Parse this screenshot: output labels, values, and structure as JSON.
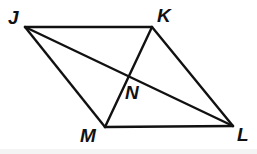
{
  "figure": {
    "name": "parallelogram-jklm-with-diagonals",
    "background_color": "#ffffff",
    "stroke_color": "#111111",
    "label_color": "#111111",
    "stroke_width": 2.4,
    "width": 257,
    "height": 154
  },
  "points": {
    "J": {
      "label": "J",
      "x": 25,
      "y": 27,
      "label_x": 8,
      "label_y": 8
    },
    "K": {
      "label": "K",
      "x": 152,
      "y": 27,
      "label_x": 157,
      "label_y": 6
    },
    "L": {
      "label": "L",
      "x": 233,
      "y": 126,
      "label_x": 237,
      "label_y": 125
    },
    "M": {
      "label": "M",
      "x": 105,
      "y": 127,
      "label_x": 80,
      "label_y": 126
    },
    "N": {
      "label": "N",
      "x": 128,
      "y": 78,
      "label_x": 125,
      "label_y": 83
    }
  },
  "segments": [
    {
      "name": "side-JK",
      "from": "J",
      "to": "K",
      "d": "M 25 27 L 152 27"
    },
    {
      "name": "side-KL",
      "from": "K",
      "to": "L",
      "d": "M 152 27 L 233 126"
    },
    {
      "name": "side-ML",
      "from": "M",
      "to": "L",
      "d": "M 105 127 L 233 126"
    },
    {
      "name": "side-JM",
      "from": "J",
      "to": "M",
      "d": "M 25 27 L 105 127"
    },
    {
      "name": "diagonal-JL",
      "from": "J",
      "to": "L",
      "d": "M 25 27 L 233 126"
    },
    {
      "name": "diagonal-KM",
      "from": "K",
      "to": "M",
      "d": "M 152 27 L 105 127"
    }
  ],
  "chart_data": {
    "type": "diagram",
    "title": "",
    "shape": "parallelogram",
    "vertices": [
      {
        "name": "J",
        "x": 25,
        "y": 27
      },
      {
        "name": "K",
        "x": 152,
        "y": 27
      },
      {
        "name": "L",
        "x": 233,
        "y": 126
      },
      {
        "name": "M",
        "x": 105,
        "y": 127
      }
    ],
    "intersection": {
      "name": "N",
      "x": 128,
      "y": 78
    },
    "edges": [
      "JK",
      "KL",
      "LM",
      "MJ"
    ],
    "diagonals": [
      "JL",
      "KM"
    ],
    "labels": [
      "J",
      "K",
      "N",
      "M",
      "L"
    ]
  }
}
